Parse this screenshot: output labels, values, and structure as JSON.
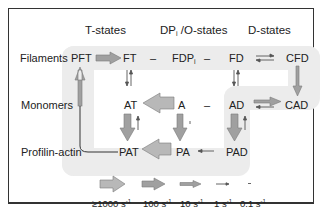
{
  "diagram": {
    "headers": {
      "t_states": "T-states",
      "dpi_prefix": "DP",
      "dpi_sub": "i",
      "dpi_suffix": " /O-states",
      "d_states": "D-states"
    },
    "row_labels": {
      "filaments": "Filaments",
      "monomers": "Monomers",
      "profilin_actin": "Profilin-actin"
    },
    "nodes": {
      "PFT": "PFT",
      "FT": "FT",
      "FDPi_main": "FDP",
      "FDPi_sub": "i",
      "FD": "FD",
      "CFD": "CFD",
      "AT": "AT",
      "A": "A",
      "AD": "AD",
      "CAD": "CAD",
      "PAT": "PAT",
      "PA": "PA",
      "PAD": "PAD"
    },
    "dashes": {
      "ft_fdpi": "–",
      "fdpi_fd": "–",
      "a_ad": "–"
    },
    "edges": [
      {
        "from": "PFT",
        "to": "FT",
        "rate": "100 s-1"
      },
      {
        "from": "FD",
        "to": "CFD",
        "rate": "reversible 1 s-1"
      },
      {
        "from": "FT",
        "to": "AT",
        "rate": "reversible 1 s-1"
      },
      {
        "from": "FD",
        "to": "AD",
        "rate": "reversible 1 s-1"
      },
      {
        "from": "CFD",
        "to": "CAD",
        "rate": "10 s-1"
      },
      {
        "from": "A",
        "to": "AT",
        "rate": ">=1000 s-1"
      },
      {
        "from": "AD",
        "to": "CAD",
        "rate": "10 s-1 / reverse 1 s-1"
      },
      {
        "from": "AT",
        "to": "PAT",
        "rate": "100 s-1 / reverse 1 s-1"
      },
      {
        "from": "A",
        "to": "PA",
        "rate": "100 s-1 / reverse 0.1 s-1"
      },
      {
        "from": "AD",
        "to": "PAD",
        "rate": "100 s-1 / reverse 1 s-1"
      },
      {
        "from": "PA",
        "to": "PAT",
        "rate": ">=1000 s-1"
      },
      {
        "from": "PAD",
        "to": "PA",
        "rate": "1 s-1"
      },
      {
        "from": "PAT",
        "to": "PFT",
        "rate": "10 s-1"
      }
    ],
    "legend": [
      {
        "label": "≥1000 s",
        "exp": "-1",
        "size": "largest"
      },
      {
        "label": "100 s",
        "exp": "-1",
        "size": "large"
      },
      {
        "label": "10 s",
        "exp": "-1",
        "size": "medium"
      },
      {
        "label": "1 s",
        "exp": "-1",
        "size": "small"
      },
      {
        "label": "0.1 s",
        "exp": "-1",
        "size": "tiny"
      }
    ],
    "colors": {
      "arrow_fill": "#9a9a9a",
      "arrow_light": "#bdbdbd",
      "background_region": "#ececec",
      "border": "#333333",
      "text": "#222222"
    }
  }
}
